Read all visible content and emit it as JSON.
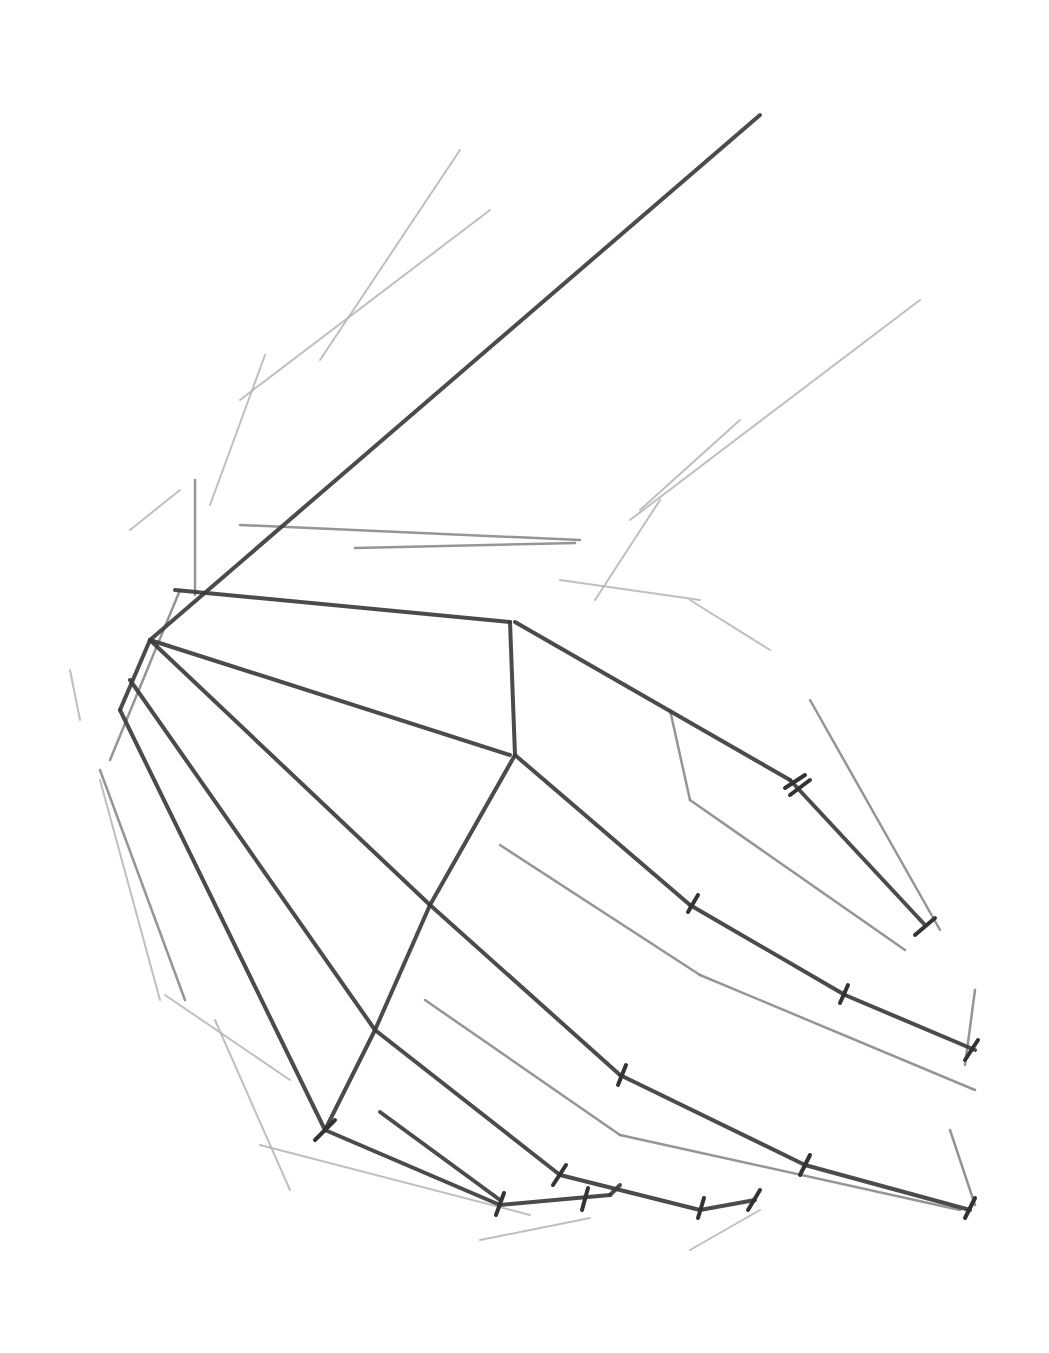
{
  "image": {
    "subject": "pencil construction sketch of a hand",
    "background": "#ffffff",
    "stroke_colors": {
      "dark": "#3c3c3c",
      "mid": "#8a8a8a",
      "light": "#b4b4b4"
    }
  },
  "strokes": {
    "dark": [
      [
        150,
        640,
        760,
        115
      ],
      [
        175,
        590,
        510,
        622
      ],
      [
        150,
        640,
        510,
        755
      ],
      [
        510,
        622,
        515,
        755
      ],
      [
        515,
        622,
        790,
        780
      ],
      [
        790,
        780,
        925,
        925
      ],
      [
        515,
        755,
        430,
        905
      ],
      [
        430,
        905,
        375,
        1030
      ],
      [
        375,
        1030,
        325,
        1130
      ],
      [
        150,
        640,
        120,
        710
      ],
      [
        150,
        640,
        430,
        905
      ],
      [
        130,
        680,
        375,
        1030
      ],
      [
        120,
        710,
        325,
        1130
      ],
      [
        515,
        755,
        690,
        905
      ],
      [
        690,
        905,
        845,
        995
      ],
      [
        845,
        995,
        975,
        1050
      ],
      [
        430,
        905,
        620,
        1075
      ],
      [
        620,
        1075,
        805,
        1165
      ],
      [
        805,
        1165,
        970,
        1210
      ],
      [
        375,
        1030,
        560,
        1175
      ],
      [
        560,
        1175,
        700,
        1210
      ],
      [
        700,
        1210,
        755,
        1200
      ],
      [
        325,
        1130,
        500,
        1205
      ],
      [
        500,
        1205,
        610,
        1195
      ],
      [
        610,
        1195,
        620,
        1185
      ],
      [
        380,
        1112,
        500,
        1200
      ]
    ],
    "ticks": [
      [
        785,
        788,
        805,
        775
      ],
      [
        790,
        795,
        810,
        780
      ],
      [
        688,
        912,
        698,
        895
      ],
      [
        840,
        1003,
        848,
        985
      ],
      [
        618,
        1085,
        626,
        1065
      ],
      [
        800,
        1175,
        810,
        1155
      ],
      [
        553,
        1185,
        566,
        1165
      ],
      [
        496,
        1215,
        504,
        1193
      ],
      [
        582,
        1210,
        588,
        1188
      ],
      [
        698,
        1218,
        704,
        1198
      ],
      [
        748,
        1210,
        760,
        1190
      ],
      [
        915,
        935,
        935,
        918
      ],
      [
        965,
        1060,
        978,
        1040
      ],
      [
        965,
        1218,
        975,
        1198
      ],
      [
        315,
        1140,
        335,
        1120
      ]
    ],
    "mid": [
      [
        500,
        845,
        700,
        975
      ],
      [
        700,
        975,
        975,
        1090
      ],
      [
        425,
        1000,
        620,
        1135
      ],
      [
        620,
        1135,
        960,
        1210
      ],
      [
        240,
        525,
        580,
        540
      ],
      [
        355,
        548,
        575,
        543
      ],
      [
        810,
        700,
        940,
        930
      ],
      [
        670,
        710,
        690,
        800
      ],
      [
        690,
        800,
        905,
        950
      ],
      [
        975,
        990,
        965,
        1065
      ],
      [
        950,
        1130,
        975,
        1205
      ],
      [
        195,
        595,
        195,
        480
      ],
      [
        180,
        590,
        110,
        760
      ],
      [
        100,
        770,
        185,
        1000
      ]
    ],
    "light": [
      [
        240,
        400,
        490,
        210
      ],
      [
        320,
        360,
        460,
        150
      ],
      [
        210,
        505,
        265,
        355
      ],
      [
        130,
        530,
        180,
        490
      ],
      [
        260,
        1145,
        530,
        1215
      ],
      [
        480,
        1240,
        590,
        1218
      ],
      [
        690,
        1250,
        760,
        1210
      ],
      [
        630,
        520,
        920,
        300
      ],
      [
        640,
        510,
        740,
        420
      ],
      [
        595,
        600,
        660,
        500
      ],
      [
        690,
        600,
        770,
        650
      ],
      [
        560,
        580,
        700,
        600
      ],
      [
        165,
        995,
        290,
        1080
      ],
      [
        215,
        1020,
        290,
        1190
      ],
      [
        70,
        670,
        80,
        720
      ],
      [
        100,
        780,
        160,
        1000
      ]
    ]
  }
}
